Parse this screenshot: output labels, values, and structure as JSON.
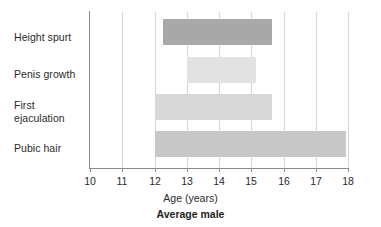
{
  "chart_data": {
    "type": "bar",
    "orientation": "horizontal",
    "title": "Average male",
    "xlabel": "Age (years)",
    "ylabel": "",
    "xlim": [
      10,
      18
    ],
    "xticks": [
      "10",
      "11",
      "12",
      "13",
      "14",
      "15",
      "16",
      "17",
      "18"
    ],
    "grid": true,
    "legend": "none",
    "categories": [
      "Height spurt",
      "Penis growth",
      "First ejaculation",
      "Pubic hair"
    ],
    "bars": [
      {
        "label": "Height spurt",
        "start": 12.25,
        "end": 15.65,
        "color": "#a8a8a8"
      },
      {
        "label": "Penis growth",
        "start": 13.0,
        "end": 15.15,
        "color": "#e2e2e2"
      },
      {
        "label": "First ejaculation",
        "start": 12.0,
        "end": 15.65,
        "color": "#d8d8d8"
      },
      {
        "label": "Pubic hair",
        "start": 12.0,
        "end": 17.95,
        "color": "#c8c8c8"
      }
    ]
  },
  "axis": {
    "x_title": "Age (years)",
    "tick_labels": [
      "10",
      "11",
      "12",
      "13",
      "14",
      "15",
      "16",
      "17",
      "18"
    ]
  },
  "caption": {
    "text": "Average male"
  },
  "categories": {
    "items": [
      {
        "line1": "Height spurt",
        "line2": ""
      },
      {
        "line1": "Penis growth",
        "line2": ""
      },
      {
        "line1": "First",
        "line2": "ejaculation"
      },
      {
        "line1": "Pubic hair",
        "line2": ""
      }
    ]
  },
  "colors": {
    "axis": "#8b8b8b",
    "grid": "#d6d6d6",
    "text": "#2b2b2b",
    "background": "#ffffff"
  }
}
